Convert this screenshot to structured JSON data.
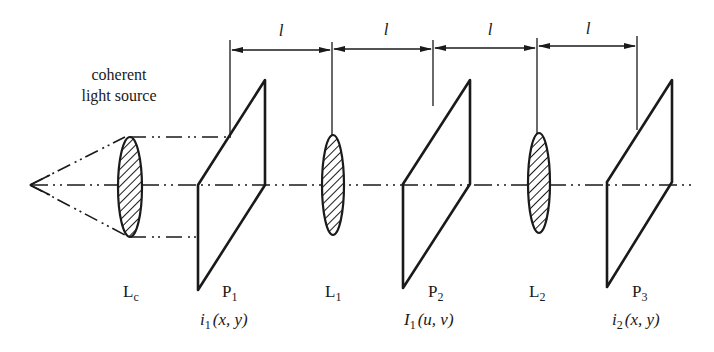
{
  "diagram": {
    "type": "4f optical correlator / coherent optical processing system",
    "source_label": [
      "coherent",
      "light source"
    ],
    "dimension_label": "l",
    "dimension_segments": 4,
    "components": [
      {
        "id": "Lc",
        "kind": "lens",
        "label_main": "L",
        "label_sub": "c"
      },
      {
        "id": "P1",
        "kind": "plane",
        "label_main": "P",
        "label_sub": "1",
        "function": {
          "main": "i",
          "sub": "1",
          "args": "(x, y)"
        }
      },
      {
        "id": "L1",
        "kind": "lens",
        "label_main": "L",
        "label_sub": "1"
      },
      {
        "id": "P2",
        "kind": "plane",
        "label_main": "P",
        "label_sub": "2",
        "function": {
          "main": "I",
          "sub": "1",
          "args": "(u, v)"
        }
      },
      {
        "id": "L2",
        "kind": "lens",
        "label_main": "L",
        "label_sub": "2"
      },
      {
        "id": "P3",
        "kind": "plane",
        "label_main": "P",
        "label_sub": "3",
        "function": {
          "main": "i",
          "sub": "2",
          "args": "(x, y)"
        }
      }
    ],
    "colors": {
      "line": "#1a1a1a",
      "background": "#ffffff"
    }
  }
}
